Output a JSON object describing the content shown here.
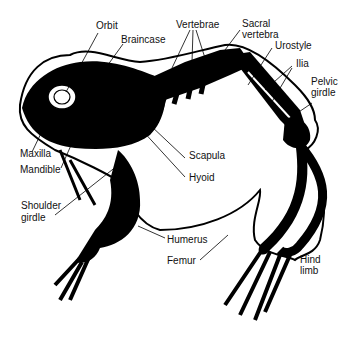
{
  "diagram": {
    "labels": {
      "orbit": "Orbit",
      "braincase": "Braincase",
      "vertebrae": "Vertebrae",
      "sacral_1": "Sacral",
      "sacral_2": "vertebra",
      "urostyle": "Urostyle",
      "ilia": "Ilia",
      "pelvic_1": "Pelvic",
      "pelvic_2": "girdle",
      "maxilla": "Maxilla",
      "mandible": "Mandible",
      "scapula": "Scapula",
      "hyoid": "Hyoid",
      "shoulder_1": "Shoulder",
      "shoulder_2": "girdle",
      "humerus": "Humerus",
      "femur": "Femur",
      "hind_1": "Hind",
      "hind_2": "limb"
    }
  }
}
